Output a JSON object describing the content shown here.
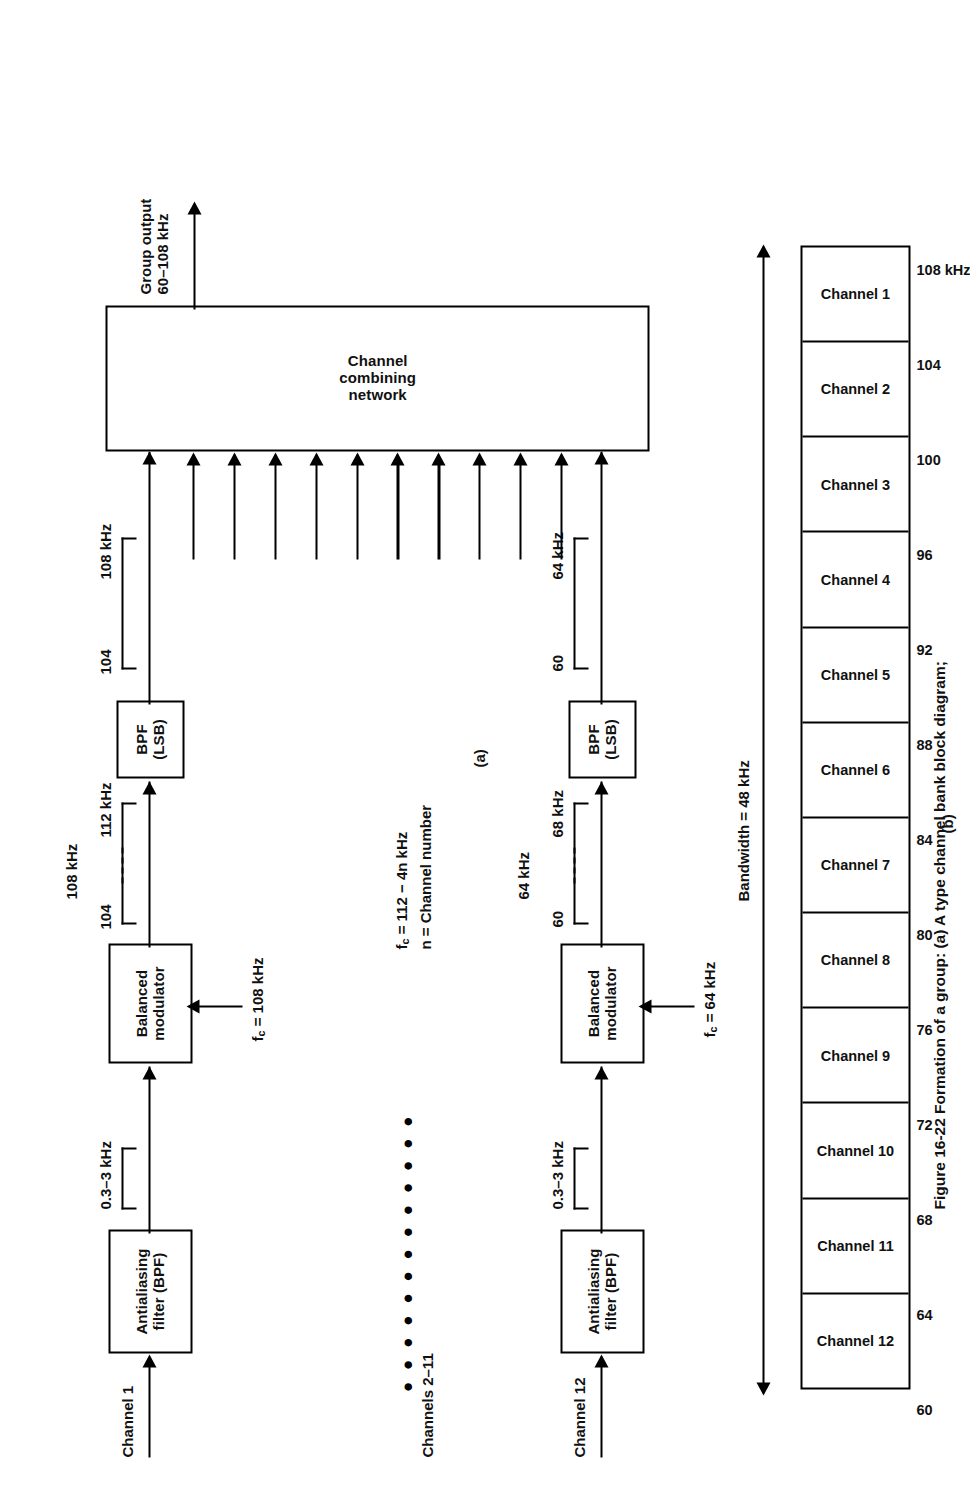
{
  "figure": {
    "caption": "Figure 16-22   Formation of a group: (a) A type channel bank block diagram;",
    "part_a_label": "(a)",
    "part_b_label": "(b)"
  },
  "diagram": {
    "title": "A type channel bank block diagram",
    "group_output_label": "Group output\n60–108 kHz",
    "group_output_line1": "Group output",
    "group_output_line2": "60–108 kHz",
    "combining_network_line1": "Channel",
    "combining_network_line2": "combining",
    "combining_network_line3": "network",
    "carrier_formula_line1": "f",
    "carrier_formula_line1_sub": "c",
    "carrier_formula_line1_rest": " = 112 − 4n kHz",
    "carrier_formula_line2": "n = Channel number",
    "middle_channels_label": "Channels 2–11",
    "arrow_count": 12
  },
  "branch_top": {
    "input_label": "Channel 1",
    "filter_line1": "Antialiasing",
    "filter_line2": "filter (BPF)",
    "baseband_span": "0.3–3 kHz",
    "modulator_line1": "Balanced",
    "modulator_line2": "modulator",
    "carrier_prefix": "f",
    "carrier_sub": "c",
    "carrier_value": " = 108 kHz",
    "dsb_low": "104",
    "dsb_high": "112 kHz",
    "dsb_center": "108 kHz",
    "bpf_line1": "BPF",
    "bpf_line2": "(LSB)",
    "lsb_low": "104",
    "lsb_high": "108 kHz"
  },
  "branch_bottom": {
    "input_label": "Channel 12",
    "filter_line1": "Antialiasing",
    "filter_line2": "filter (BPF)",
    "baseband_span": "0.3–3 kHz",
    "modulator_line1": "Balanced",
    "modulator_line2": "modulator",
    "carrier_prefix": "f",
    "carrier_sub": "c",
    "carrier_value": " = 64 kHz",
    "dsb_low": "60",
    "dsb_high": "68 kHz",
    "dsb_center": "64 kHz",
    "bpf_line1": "BPF",
    "bpf_line2": "(LSB)",
    "lsb_low": "60",
    "lsb_high": "64 kHz"
  },
  "chart_data": {
    "type": "bar",
    "xlabel": "Frequency (kHz)",
    "ylabel": "",
    "bandwidth_label": "Bandwidth = 48 kHz",
    "xlim": [
      60,
      108
    ],
    "grid": false,
    "legend": "none",
    "tick_labels": [
      "60",
      "64",
      "68",
      "72",
      "76",
      "80",
      "84",
      "88",
      "92",
      "96",
      "100",
      "104",
      "108 kHz"
    ],
    "tick_values": [
      60,
      64,
      68,
      72,
      76,
      80,
      84,
      88,
      92,
      96,
      100,
      104,
      108
    ],
    "categories": [
      "Channel 12",
      "Channel 11",
      "Channel 10",
      "Channel 9",
      "Channel 8",
      "Channel 7",
      "Channel 6",
      "Channel 5",
      "Channel 4",
      "Channel 3",
      "Channel 2",
      "Channel 1"
    ],
    "values": [
      4,
      4,
      4,
      4,
      4,
      4,
      4,
      4,
      4,
      4,
      4,
      4
    ],
    "bands": [
      {
        "label": "Channel 12",
        "start": 60,
        "end": 64
      },
      {
        "label": "Channel 11",
        "start": 64,
        "end": 68
      },
      {
        "label": "Channel 10",
        "start": 68,
        "end": 72
      },
      {
        "label": "Channel 9",
        "start": 72,
        "end": 76
      },
      {
        "label": "Channel 8",
        "start": 76,
        "end": 80
      },
      {
        "label": "Channel 7",
        "start": 80,
        "end": 84
      },
      {
        "label": "Channel 6",
        "start": 84,
        "end": 88
      },
      {
        "label": "Channel 5",
        "start": 88,
        "end": 92
      },
      {
        "label": "Channel 4",
        "start": 92,
        "end": 96
      },
      {
        "label": "Channel 3",
        "start": 96,
        "end": 100
      },
      {
        "label": "Channel 2",
        "start": 100,
        "end": 104
      },
      {
        "label": "Channel 1",
        "start": 104,
        "end": 108
      }
    ]
  }
}
